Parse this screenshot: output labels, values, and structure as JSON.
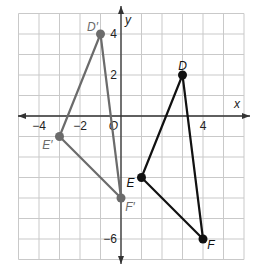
{
  "diagram": {
    "type": "coordinate-plane",
    "x_range": [
      -5,
      6
    ],
    "y_range": [
      -7,
      5
    ],
    "axis_labels": {
      "x": "x",
      "y": "y"
    },
    "tick_labels": {
      "x": [
        {
          "v": -4,
          "t": "−4"
        },
        {
          "v": -2,
          "t": "−2"
        },
        {
          "v": 4,
          "t": "4"
        }
      ],
      "y": [
        {
          "v": 4,
          "t": "4"
        },
        {
          "v": 2,
          "t": "2"
        },
        {
          "v": -6,
          "t": "−6"
        }
      ],
      "origin": "O"
    },
    "triangles": [
      {
        "name": "DEF",
        "color": "#111111",
        "vertices": [
          {
            "label": "D",
            "x": 3,
            "y": 2
          },
          {
            "label": "E",
            "x": 1,
            "y": -3
          },
          {
            "label": "F",
            "x": 4,
            "y": -6
          }
        ]
      },
      {
        "name": "D'E'F'",
        "color": "#6b6b6b",
        "vertices": [
          {
            "label": "D′",
            "x": -1,
            "y": 4
          },
          {
            "label": "E′",
            "x": -3,
            "y": -1
          },
          {
            "label": "F′",
            "x": 0,
            "y": -4
          }
        ]
      }
    ]
  }
}
